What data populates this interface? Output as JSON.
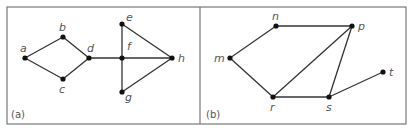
{
  "figure": {
    "frame": {
      "x": 7,
      "y": 7,
      "width": 399,
      "height": 117,
      "divider_x": 200,
      "stroke": "#777777"
    },
    "edge_color": "#333333",
    "node_color": "#111111",
    "label_color": "#555555",
    "panels": [
      {
        "id": "a",
        "label": "(a)",
        "label_pos": [
          11,
          118
        ],
        "nodes": [
          {
            "id": "a",
            "label": "a",
            "x": 25,
            "y": 58,
            "lx": 20,
            "ly": 52
          },
          {
            "id": "b",
            "label": "b",
            "x": 63,
            "y": 37,
            "lx": 59,
            "ly": 31
          },
          {
            "id": "c",
            "label": "c",
            "x": 63,
            "y": 79,
            "lx": 59,
            "ly": 93
          },
          {
            "id": "d",
            "label": "d",
            "x": 89,
            "y": 58,
            "lx": 87,
            "ly": 52
          },
          {
            "id": "e",
            "label": "e",
            "x": 122,
            "y": 24,
            "lx": 126,
            "ly": 21
          },
          {
            "id": "f",
            "label": "f",
            "x": 122,
            "y": 58,
            "lx": 127,
            "ly": 50
          },
          {
            "id": "g",
            "label": "g",
            "x": 122,
            "y": 92,
            "lx": 125,
            "ly": 101
          },
          {
            "id": "h",
            "label": "h",
            "x": 172,
            "y": 58,
            "lx": 178,
            "ly": 62
          }
        ],
        "edges": [
          [
            "a",
            "b"
          ],
          [
            "a",
            "c"
          ],
          [
            "b",
            "d"
          ],
          [
            "c",
            "d"
          ],
          [
            "d",
            "f"
          ],
          [
            "f",
            "h"
          ],
          [
            "e",
            "f"
          ],
          [
            "f",
            "g"
          ],
          [
            "e",
            "h"
          ],
          [
            "g",
            "h"
          ]
        ]
      },
      {
        "id": "b",
        "label": "(b)",
        "label_pos": [
          206,
          118
        ],
        "nodes": [
          {
            "id": "m",
            "label": "m",
            "x": 230,
            "y": 58,
            "lx": 214,
            "ly": 62
          },
          {
            "id": "n",
            "label": "n",
            "x": 276,
            "y": 26,
            "lx": 272,
            "ly": 20
          },
          {
            "id": "p",
            "label": "p",
            "x": 352,
            "y": 26,
            "lx": 358,
            "ly": 30
          },
          {
            "id": "r",
            "label": "r",
            "x": 273,
            "y": 97,
            "lx": 270,
            "ly": 111
          },
          {
            "id": "s",
            "label": "s",
            "x": 329,
            "y": 97,
            "lx": 326,
            "ly": 111
          },
          {
            "id": "t",
            "label": "t",
            "x": 383,
            "y": 72,
            "lx": 389,
            "ly": 76
          }
        ],
        "edges": [
          [
            "m",
            "n"
          ],
          [
            "n",
            "p"
          ],
          [
            "m",
            "r"
          ],
          [
            "r",
            "p"
          ],
          [
            "r",
            "s"
          ],
          [
            "s",
            "p"
          ],
          [
            "s",
            "t"
          ]
        ]
      }
    ]
  }
}
